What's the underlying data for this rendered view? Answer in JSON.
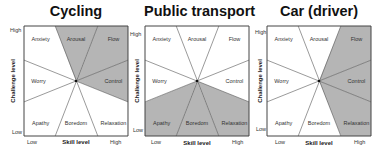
{
  "colors": {
    "shade": "#b5b5b5",
    "line": "#555555",
    "border": "#444444",
    "background": "#ffffff"
  },
  "axes": {
    "x_title": "Skill level",
    "y_title": "Challenge level",
    "x_low": "Low",
    "x_high": "High",
    "y_low": "Low",
    "y_high": "High"
  },
  "segments": {
    "anxiety": "Anxiety",
    "arousal": "Arousal",
    "flow": "Flow",
    "control": "Control",
    "relaxation": "Relaxation",
    "boredom": "Boredom",
    "apathy": "Apathy",
    "worry": "Worry"
  },
  "charts": [
    {
      "title": "Cycling",
      "shaded": [
        "arousal",
        "flow",
        "control"
      ]
    },
    {
      "title": "Public transport",
      "shaded": [
        "apathy",
        "boredom",
        "relaxation"
      ]
    },
    {
      "title": "Car (driver)",
      "shaded": [
        "flow",
        "control",
        "relaxation"
      ]
    }
  ],
  "chart_data": [
    {
      "type": "table",
      "title": "Cycling",
      "xlabel": "Skill level",
      "ylabel": "Challenge level",
      "x_ticks": [
        "Low",
        "High"
      ],
      "y_ticks": [
        "Low",
        "High"
      ],
      "categories": [
        "Anxiety",
        "Arousal",
        "Flow",
        "Worry",
        "Control",
        "Apathy",
        "Boredom",
        "Relaxation"
      ],
      "highlighted": [
        "Arousal",
        "Flow",
        "Control"
      ]
    },
    {
      "type": "table",
      "title": "Public transport",
      "xlabel": "Skill level",
      "ylabel": "Challenge level",
      "x_ticks": [
        "Low",
        "High"
      ],
      "y_ticks": [
        "Low",
        "High"
      ],
      "categories": [
        "Anxiety",
        "Arousal",
        "Flow",
        "Worry",
        "Control",
        "Apathy",
        "Boredom",
        "Relaxation"
      ],
      "highlighted": [
        "Apathy",
        "Boredom",
        "Relaxation"
      ]
    },
    {
      "type": "table",
      "title": "Car (driver)",
      "xlabel": "Skill level",
      "ylabel": "Challenge level",
      "x_ticks": [
        "Low",
        "High"
      ],
      "y_ticks": [
        "Low",
        "High"
      ],
      "categories": [
        "Anxiety",
        "Arousal",
        "Flow",
        "Worry",
        "Control",
        "Apathy",
        "Boredom",
        "Relaxation"
      ],
      "highlighted": [
        "Flow",
        "Control",
        "Relaxation"
      ]
    }
  ]
}
